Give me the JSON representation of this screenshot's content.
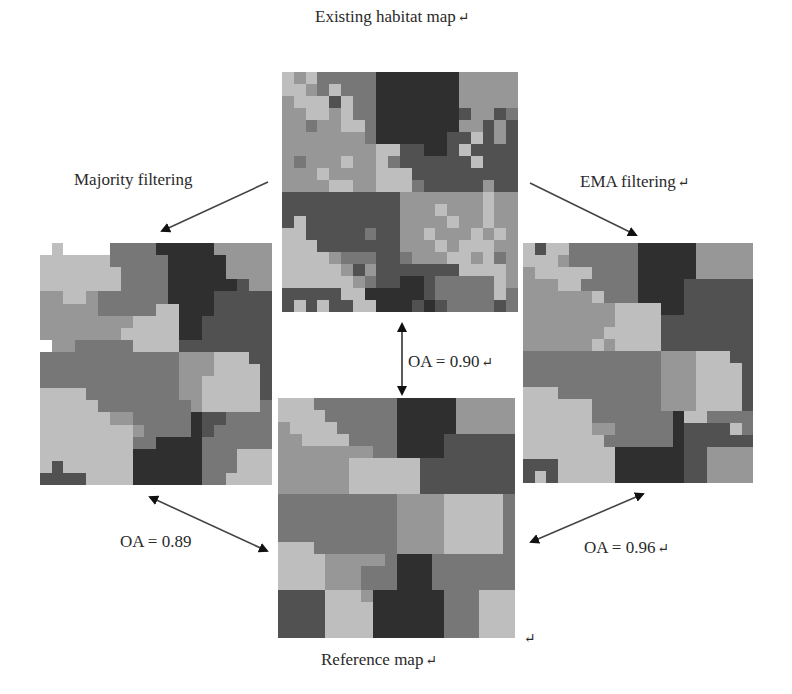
{
  "labels": {
    "existing": "Existing habitat map",
    "majority": "Majority filtering",
    "ema": "EMA filtering",
    "reference": "Reference map",
    "oa_existing": "OA = 0.90",
    "oa_majority": "OA = 0.89",
    "oa_ema": "OA = 0.96",
    "return_mark": "↵"
  },
  "palette": {
    "0": "#bebebe",
    "1": "#979797",
    "2": "#777777",
    "3": "#515151",
    "4": "#2f2f2f"
  },
  "maps": {
    "existing": {
      "grid": [
        "01022222444444411111",
        "00120222444444411111",
        "10003022444444411111",
        "11001022444444431132",
        "11211002444444411313",
        "11111112444444330313",
        "11111111003344303333",
        "12111011023333330333",
        "11101111000333333333",
        "11110011000233333133",
        "33333333331111111011",
        "33333333331110111011",
        "30333333331111011011",
        "00333332331101110101",
        "00033333331110100011",
        "00001222332111001021",
        "00000131333333300001",
        "00000012334432222201",
        "33333004444432222202",
        "30303300444343222232",
        "33033002444444222212",
        "33330004444442222202"
      ]
    },
    "majority": {
      "grid": [
        "w0wwww22224444411111",
        "000000222224444411111",
        "00000002222444441111",
        "00000002222444444311",
        "11001222222444433333",
        "11111222220044433333",
        "11111111000044333333",
        "11111110000044333333",
        "w1122222000033333333",
        "22222222222211100033",
        "22222222222211100003",
        "22222222222211000003",
        "00002222222211000003",
        "00000222222221000002",
        "00000011222224332222",
        "00000000122224322222",
        "00000000224444222222",
        "00000000444444222000",
        "03000000444444222000",
        "33330000444444220000",
        "w3333300444444442000"
      ]
    },
    "ema": {
      "grid": [
        "03002222224444411111",
        "00012222224444411111",
        "10000022224444411111",
        "11100222224444333333",
        "11111102224444333333",
        "11111111000044333333",
        "11111111000033333333",
        "11111110000033333333",
        "11111101000033333333",
        "22222222222211100033",
        "22222222222211100003",
        "22222222222211100003",
        "00022222222211100003",
        "00000022222211100003",
        "00000022222224002222",
        "00000011222224333302",
        "00000002222224333333",
        "00000000444444331111",
        "33300000444444331111",
        "30300000444444331111",
        "33030000444444331111"
      ]
    },
    "reference": {
      "grid": [
        "00022222224444411111",
        "00002222224444411111",
        "10000222224444411111",
        "11000022224444333333",
        "11111111224444333333",
        "11111100000033333333",
        "11111100000033333333",
        "11111100000033333333",
        "22222222221111000002",
        "22222222221111000002",
        "22222222221111000002",
        "22222222221111000002",
        "00022222221111000002",
        "00001111124442222222",
        "00001112224442222222",
        "00001112224442222222",
        "33330001444444222000",
        "33330000444444222000",
        "33330000444444222000",
        "33330000444444222000"
      ]
    }
  }
}
